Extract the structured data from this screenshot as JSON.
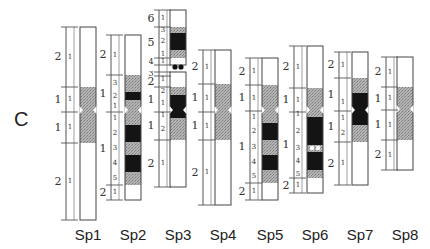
{
  "figure": {
    "panel_label": "C",
    "colors": {
      "white": "#ffffff",
      "gray": "#a9a9a9",
      "black": "#141414",
      "outline": "#444444"
    },
    "centromere_y": 112,
    "chromosomes": [
      {
        "name": "Sp1",
        "x": 80,
        "ruler_x": 66,
        "label_x": 65,
        "regions": [
          {
            "arm": "p",
            "num": "2",
            "y0": 27,
            "y1": 87
          },
          {
            "arm": "p",
            "num": "1",
            "y0": 87,
            "y1": 112
          },
          {
            "arm": "q",
            "num": "1",
            "y0": 112,
            "y1": 143
          },
          {
            "arm": "q",
            "num": "2",
            "y0": 143,
            "y1": 220
          }
        ],
        "bands": [
          {
            "y0": 27,
            "y1": 87,
            "c": "white",
            "n": "1"
          },
          {
            "y0": 87,
            "y1": 112,
            "c": "gray",
            "n": "1"
          },
          {
            "y0": 112,
            "y1": 143,
            "c": "gray",
            "n": "1"
          },
          {
            "y0": 143,
            "y1": 220,
            "c": "white",
            "n": "1"
          }
        ],
        "constriction": 110
      },
      {
        "name": "Sp2",
        "x": 125,
        "ruler_x": 111,
        "label_x": 110,
        "regions": [
          {
            "arm": "p",
            "num": "2",
            "y0": 35,
            "y1": 75
          },
          {
            "arm": "p",
            "num": "1",
            "y0": 75,
            "y1": 112
          },
          {
            "arm": "q",
            "num": "1",
            "y0": 112,
            "y1": 185
          },
          {
            "arm": "q",
            "num": "2",
            "y0": 185,
            "y1": 200
          }
        ],
        "bands": [
          {
            "y0": 35,
            "y1": 75,
            "c": "white",
            "n": "1"
          },
          {
            "y0": 75,
            "y1": 92,
            "c": "gray",
            "n": "3"
          },
          {
            "y0": 92,
            "y1": 100,
            "c": "black",
            "n": "2"
          },
          {
            "y0": 100,
            "y1": 112,
            "c": "gray",
            "n": "1"
          },
          {
            "y0": 112,
            "y1": 125,
            "c": "gray",
            "n": "1"
          },
          {
            "y0": 125,
            "y1": 142,
            "c": "black",
            "n": "2"
          },
          {
            "y0": 142,
            "y1": 155,
            "c": "gray",
            "n": "3"
          },
          {
            "y0": 155,
            "y1": 172,
            "c": "black",
            "n": "4"
          },
          {
            "y0": 172,
            "y1": 185,
            "c": "gray",
            "n": "5"
          },
          {
            "y0": 185,
            "y1": 200,
            "c": "white",
            "n": "1"
          }
        ],
        "constriction": 110
      },
      {
        "name": "Sp3",
        "x": 170,
        "ruler_x": 159,
        "label_x": 155,
        "regions": [
          {
            "arm": "p",
            "num": "6",
            "y0": 10,
            "y1": 27
          },
          {
            "arm": "p",
            "num": "5",
            "y0": 27,
            "y1": 58
          },
          {
            "arm": "p",
            "num": "4",
            "y0": 58,
            "y1": 65
          },
          {
            "arm": "p",
            "num": "3",
            "y0": 72,
            "y1": 76
          },
          {
            "arm": "p",
            "num": "2",
            "y0": 76,
            "y1": 87
          },
          {
            "arm": "p",
            "num": "1",
            "y0": 87,
            "y1": 112
          },
          {
            "arm": "q",
            "num": "1",
            "y0": 112,
            "y1": 140
          },
          {
            "arm": "q",
            "num": "2",
            "y0": 140,
            "y1": 187
          }
        ],
        "bands": [
          {
            "y0": 10,
            "y1": 27,
            "c": "white",
            "n": "1"
          },
          {
            "y0": 27,
            "y1": 33,
            "c": "gray",
            "n": "3"
          },
          {
            "y0": 33,
            "y1": 50,
            "c": "black",
            "n": "2"
          },
          {
            "y0": 50,
            "y1": 58,
            "c": "gray",
            "n": "1"
          },
          {
            "y0": 58,
            "y1": 65,
            "c": "white",
            "n": "1"
          },
          {
            "y0": 72,
            "y1": 87,
            "c": "white",
            "n": "1"
          },
          {
            "y0": 87,
            "y1": 95,
            "c": "gray",
            "n": "2"
          },
          {
            "y0": 95,
            "y1": 112,
            "c": "black",
            "n": "1"
          },
          {
            "y0": 112,
            "y1": 118,
            "c": "black",
            "n": "1"
          },
          {
            "y0": 118,
            "y1": 140,
            "c": "gray",
            "n": "2"
          },
          {
            "y0": 140,
            "y1": 187,
            "c": "white",
            "n": "1"
          }
        ],
        "satellite": {
          "y": 67,
          "dots": "black"
        },
        "constriction": 110
      },
      {
        "name": "Sp4",
        "x": 215,
        "ruler_x": 203,
        "label_x": 200,
        "regions": [
          {
            "arm": "p",
            "num": "2",
            "y0": 50,
            "y1": 84
          },
          {
            "arm": "p",
            "num": "1",
            "y0": 84,
            "y1": 112
          },
          {
            "arm": "q",
            "num": "1",
            "y0": 112,
            "y1": 140
          },
          {
            "arm": "q",
            "num": "2",
            "y0": 140,
            "y1": 205
          }
        ],
        "bands": [
          {
            "y0": 50,
            "y1": 84,
            "c": "white",
            "n": "1"
          },
          {
            "y0": 84,
            "y1": 112,
            "c": "gray",
            "n": "1"
          },
          {
            "y0": 112,
            "y1": 140,
            "c": "gray",
            "n": "1"
          },
          {
            "y0": 140,
            "y1": 205,
            "c": "white",
            "n": "1"
          }
        ],
        "constriction": 110
      },
      {
        "name": "Sp5",
        "x": 262,
        "ruler_x": 250,
        "label_x": 246,
        "regions": [
          {
            "arm": "p",
            "num": "2",
            "y0": 58,
            "y1": 85
          },
          {
            "arm": "p",
            "num": "1",
            "y0": 85,
            "y1": 111
          },
          {
            "arm": "q",
            "num": "1",
            "y0": 111,
            "y1": 183
          },
          {
            "arm": "q",
            "num": "2",
            "y0": 183,
            "y1": 200
          }
        ],
        "bands": [
          {
            "y0": 58,
            "y1": 85,
            "c": "white",
            "n": "1"
          },
          {
            "y0": 85,
            "y1": 111,
            "c": "gray",
            "n": "1"
          },
          {
            "y0": 111,
            "y1": 123,
            "c": "gray",
            "n": "1"
          },
          {
            "y0": 123,
            "y1": 140,
            "c": "black",
            "n": "2"
          },
          {
            "y0": 140,
            "y1": 155,
            "c": "gray",
            "n": "3"
          },
          {
            "y0": 155,
            "y1": 170,
            "c": "black",
            "n": "4"
          },
          {
            "y0": 170,
            "y1": 183,
            "c": "gray",
            "n": "5"
          },
          {
            "y0": 183,
            "y1": 200,
            "c": "white",
            "n": "1"
          }
        ],
        "constriction": 110
      },
      {
        "name": "Sp6",
        "x": 307,
        "ruler_x": 294,
        "label_x": 291,
        "regions": [
          {
            "arm": "p",
            "num": "2",
            "y0": 46,
            "y1": 88
          },
          {
            "arm": "p",
            "num": "1",
            "y0": 88,
            "y1": 112
          },
          {
            "arm": "q",
            "num": "1",
            "y0": 112,
            "y1": 178
          },
          {
            "arm": "q",
            "num": "2",
            "y0": 178,
            "y1": 193
          }
        ],
        "bands": [
          {
            "y0": 46,
            "y1": 88,
            "c": "white",
            "n": "1"
          },
          {
            "y0": 88,
            "y1": 112,
            "c": "gray",
            "n": "1"
          },
          {
            "y0": 112,
            "y1": 117,
            "c": "gray",
            "n": "1"
          },
          {
            "y0": 117,
            "y1": 145,
            "c": "black",
            "n": "2"
          },
          {
            "y0": 145,
            "y1": 152,
            "c": "gray",
            "n": "3"
          },
          {
            "y0": 152,
            "y1": 170,
            "c": "black",
            "n": "4"
          },
          {
            "y0": 170,
            "y1": 178,
            "c": "gray",
            "n": "5"
          },
          {
            "y0": 178,
            "y1": 193,
            "c": "white",
            "n": "1"
          }
        ],
        "white_dots_y": 148,
        "constriction": 110
      },
      {
        "name": "Sp7",
        "x": 352,
        "ruler_x": 339,
        "label_x": 336,
        "regions": [
          {
            "arm": "p",
            "num": "2",
            "y0": 52,
            "y1": 78
          },
          {
            "arm": "p",
            "num": "1",
            "y0": 78,
            "y1": 111
          },
          {
            "arm": "q",
            "num": "1",
            "y0": 111,
            "y1": 142
          },
          {
            "arm": "q",
            "num": "2",
            "y0": 142,
            "y1": 185
          }
        ],
        "bands": [
          {
            "y0": 52,
            "y1": 78,
            "c": "white",
            "n": "1"
          },
          {
            "y0": 78,
            "y1": 93,
            "c": "gray",
            "n": ""
          },
          {
            "y0": 93,
            "y1": 111,
            "c": "black",
            "n": "1"
          },
          {
            "y0": 111,
            "y1": 125,
            "c": "black",
            "n": "1"
          },
          {
            "y0": 125,
            "y1": 142,
            "c": "gray",
            "n": "2"
          },
          {
            "y0": 142,
            "y1": 185,
            "c": "white",
            "n": "1"
          }
        ],
        "constriction": 110
      },
      {
        "name": "Sp8",
        "x": 397,
        "ruler_x": 386,
        "label_x": 381,
        "regions": [
          {
            "arm": "p",
            "num": "2",
            "y0": 57,
            "y1": 87
          },
          {
            "arm": "p",
            "num": "1",
            "y0": 87,
            "y1": 110
          },
          {
            "arm": "q",
            "num": "1",
            "y0": 110,
            "y1": 140
          },
          {
            "arm": "q",
            "num": "2",
            "y0": 140,
            "y1": 170
          }
        ],
        "bands": [
          {
            "y0": 57,
            "y1": 87,
            "c": "white",
            "n": "1"
          },
          {
            "y0": 87,
            "y1": 110,
            "c": "gray",
            "n": "1"
          },
          {
            "y0": 110,
            "y1": 140,
            "c": "gray",
            "n": "1"
          },
          {
            "y0": 140,
            "y1": 170,
            "c": "white",
            "n": "1"
          }
        ],
        "constriction": 109
      }
    ],
    "labels": [
      "Sp1",
      "Sp2",
      "Sp3",
      "Sp4",
      "Sp5",
      "Sp6",
      "Sp7",
      "Sp8"
    ]
  }
}
